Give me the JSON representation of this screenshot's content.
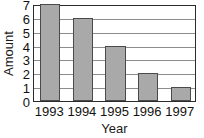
{
  "chart_data": {
    "type": "bar",
    "title": "",
    "subtitle": "",
    "categories": [
      "1993",
      "1994",
      "1995",
      "1996",
      "1997"
    ],
    "values": [
      7,
      6,
      4,
      2,
      1
    ],
    "xlabel": "Year",
    "ylabel": "Amount",
    "ylim": [
      0,
      7
    ],
    "ytick_labels": [
      "0",
      "1",
      "2",
      "3",
      "4",
      "5",
      "6",
      "7"
    ],
    "ytick_values": [
      0,
      1,
      2,
      3,
      4,
      5,
      6,
      7
    ],
    "grid": "horizontal",
    "legend": "none",
    "annotations": [],
    "colors": {
      "bar_fill": "#a9a9a9",
      "bar_edge": "#4a4a4a",
      "gridline": "#8d8d8d",
      "axis": "#2b2b2b",
      "text": "#111111",
      "plot_background": "#ffffff",
      "figure_background": "#ffffff"
    }
  }
}
